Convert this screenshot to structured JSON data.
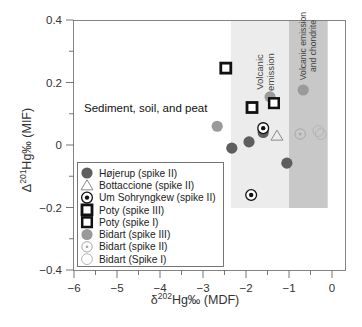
{
  "chart_data": {
    "type": "scatter",
    "title": "",
    "xlabel": "δ202Hg‰ (MDF)",
    "ylabel": "Δ201Hg‰ (MIF)",
    "xlim": [
      -6,
      0.3
    ],
    "ylim": [
      -0.4,
      0.4
    ],
    "x_ticks": [
      -6,
      -5,
      -4,
      -3,
      -2,
      -1,
      0
    ],
    "x_tick_labels": [
      "−6",
      "−5",
      "−4",
      "−3",
      "−2",
      "−1",
      "0"
    ],
    "y_ticks": [
      0.4,
      0.2,
      0,
      -0.2,
      -0.4
    ],
    "y_tick_labels": [
      "0.4",
      "0.2",
      "0",
      "−0.2",
      "−0.4"
    ],
    "grid": false,
    "legend_position": "lower-left inside",
    "annotations": [
      {
        "text": "Sediment, soil, and peat",
        "x": -5.8,
        "y": 0.11
      },
      {
        "text": "Volcanic emission",
        "orientation": "vertical",
        "region": "light band"
      },
      {
        "text": "Volcanic emission and chondrite",
        "orientation": "vertical",
        "region": "dark band"
      }
    ],
    "regions": [
      {
        "name": "Volcanic emission",
        "x": [
          -2.35,
          -1.0
        ],
        "y": [
          -0.2,
          0.4
        ],
        "color": "#ececec"
      },
      {
        "name": "Volcanic emission and chondrite",
        "x": [
          -1.0,
          -0.1
        ],
        "y": [
          -0.2,
          0.4
        ],
        "color": "#c8c8c8"
      }
    ],
    "series": [
      {
        "name": "Højerup (spike II)",
        "marker": "filled-circle-dark",
        "points": [
          [
            -2.33,
            -0.01
          ],
          [
            -1.93,
            0.01
          ],
          [
            -1.6,
            0.04
          ],
          [
            -1.05,
            -0.058
          ]
        ]
      },
      {
        "name": "Bottaccione (spike II)",
        "marker": "open-triangle",
        "points": [
          [
            -1.28,
            0.03
          ]
        ]
      },
      {
        "name": "Um Sohryngkew (spike II)",
        "marker": "bullseye",
        "points": [
          [
            -1.6,
            0.054
          ],
          [
            -1.88,
            -0.16
          ]
        ]
      },
      {
        "name": "Poty (spike III)",
        "marker": "thick-square",
        "points": [
          [
            -2.47,
            0.246
          ],
          [
            -1.86,
            0.12
          ]
        ]
      },
      {
        "name": "Poty (spike I)",
        "marker": "square",
        "points": [
          [
            -1.35,
            0.134
          ]
        ]
      },
      {
        "name": "Bidart (spike III)",
        "marker": "filled-circle-grey",
        "points": [
          [
            -2.67,
            0.06
          ],
          [
            -1.44,
            0.154
          ],
          [
            -0.67,
            0.176
          ]
        ]
      },
      {
        "name": "Bidart (spike II)",
        "marker": "dotted-circle",
        "points": [
          [
            -0.74,
            0.035
          ]
        ]
      },
      {
        "name": "Bidart (Spike I)",
        "marker": "open-circle",
        "points": [
          [
            -0.32,
            0.045
          ],
          [
            -0.26,
            0.035
          ]
        ]
      }
    ]
  },
  "labels": {
    "x_axis": {
      "delta": "δ",
      "sup": "202",
      "rest": "Hg‰ (MDF)"
    },
    "y_axis": {
      "delta": "Δ",
      "sup": "201",
      "rest": "Hg‰ (MIF)"
    },
    "annotation": "Sediment, soil, and peat",
    "band1_line1": "Volcanic",
    "band1_line2": "emission",
    "band2_line1": "Volcanic emission",
    "band2_line2": "and chondrite"
  },
  "legend": {
    "items": [
      {
        "label": "Højerup (spike II)",
        "marker": "filled-circle-dark"
      },
      {
        "label": "Bottaccione (spike II)",
        "marker": "open-triangle"
      },
      {
        "label": "Um Sohryngkew (spike II)",
        "marker": "bullseye"
      },
      {
        "label": "Poty (spike III)",
        "marker": "thick-square"
      },
      {
        "label": "Poty (spike I)",
        "marker": "square"
      },
      {
        "label": "Bidart (spike III)",
        "marker": "filled-circle-grey"
      },
      {
        "label": "Bidart (spike II)",
        "marker": "dotted-circle"
      },
      {
        "label": "Bidart (Spike I)",
        "marker": "open-circle"
      }
    ]
  },
  "colors": {
    "dark_marker": "#5e5e5e",
    "grey_marker": "#9a9a9a",
    "light_band": "#ececec",
    "dark_band": "#c9c9c9",
    "axis": "#555555",
    "square": "#111111",
    "faint": "#a8a8a8"
  }
}
